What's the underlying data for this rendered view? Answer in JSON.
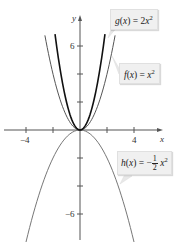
{
  "chart_data": {
    "type": "line",
    "title": "",
    "xlabel": "x",
    "ylabel": "y",
    "xlim": [
      -5.5,
      6.5
    ],
    "ylim": [
      -8.5,
      9
    ],
    "x_ticks": [
      -4,
      -2,
      0,
      2,
      4
    ],
    "x_tick_labels": [
      "-4",
      "4"
    ],
    "y_ticks": [
      -6,
      -4,
      -2,
      2,
      4,
      6
    ],
    "y_tick_labels": [
      "6",
      "-6"
    ],
    "grid": false,
    "series": [
      {
        "name": "g(x) = 2x^2",
        "function": "2*x^2",
        "x_range": [
          -1.85,
          1.85
        ],
        "color": "#111111",
        "width": 1.6
      },
      {
        "name": "f(x) = x^2",
        "function": "x^2",
        "x_range": [
          -2.6,
          2.6
        ],
        "color": "#555555",
        "width": 1.0
      },
      {
        "name": "h(x) = -1/2 x^2",
        "function": "-0.5*x^2",
        "x_range": [
          -4,
          4
        ],
        "color": "#777777",
        "width": 1.0
      }
    ],
    "annotations": [
      {
        "text": "g(x) = 2x^2",
        "points_to": "g"
      },
      {
        "text": "f(x) = x^2",
        "points_to": "f"
      },
      {
        "text": "h(x) = -1/2 x^2",
        "points_to": "h"
      }
    ]
  },
  "labels": {
    "x_axis": "x",
    "y_axis": "y",
    "x_neg4": "−4",
    "x_pos4": "4",
    "y_pos6": "6",
    "y_neg6": "−6",
    "g": {
      "name": "g",
      "var": "x",
      "eq": " = 2",
      "x": "x",
      "exp": "2"
    },
    "f": {
      "name": "f",
      "var": "x",
      "eq": " = ",
      "x": "x",
      "exp": "2"
    },
    "h": {
      "name": "h",
      "var": "x",
      "eq": " = −",
      "num": "1",
      "den": "2",
      "x": "x",
      "exp": "2"
    }
  }
}
